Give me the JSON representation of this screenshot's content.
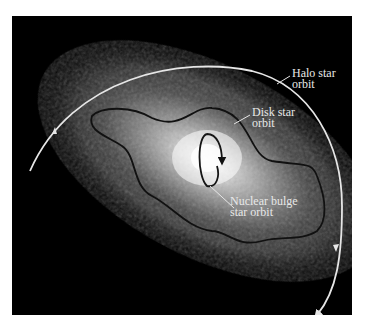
{
  "figure": {
    "labels": {
      "halo": [
        "Halo star",
        "orbit"
      ],
      "disk": [
        "Disk star",
        "orbit"
      ],
      "bulge": [
        "Nuclear bulge",
        "star orbit"
      ]
    },
    "colors": {
      "background": "#000000",
      "halo_orbit": "#e6e6e6",
      "disk_orbit": "#111111",
      "bulge_orbit": "#151515",
      "label_text": "#e8e8e8"
    }
  }
}
